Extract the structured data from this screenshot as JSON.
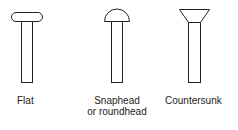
{
  "rivets": [
    {
      "id": "flat",
      "label": "Flat"
    },
    {
      "id": "snaphead",
      "label": "Snaphead",
      "label_line2": "or roundhead"
    },
    {
      "id": "countersunk",
      "label": "Countersunk"
    }
  ],
  "colors": {
    "stroke": "#222222",
    "background": "#ffffff"
  }
}
